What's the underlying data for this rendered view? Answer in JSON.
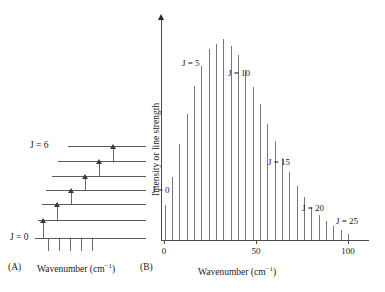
{
  "figure": {
    "panels": [
      {
        "tag": "(A)",
        "type": "energy-level-diagram",
        "axis_title": "Wavenumber (cm",
        "axis_title_sup": "−1",
        "axis_title_end": ")",
        "level_labels": [
          {
            "text": "J = 6",
            "J": 6
          },
          {
            "text": "J = 0",
            "J": 0
          }
        ],
        "levels": [
          {
            "J": 6,
            "y": 146,
            "x0": 68,
            "x1": 146
          },
          {
            "J": 5,
            "y": 161,
            "x0": 58,
            "x1": 146
          },
          {
            "J": 4,
            "y": 176,
            "x0": 52,
            "x1": 146
          },
          {
            "J": 3,
            "y": 190,
            "x0": 46,
            "x1": 146
          },
          {
            "J": 2,
            "y": 204,
            "x0": 42,
            "x1": 146
          },
          {
            "J": 1,
            "y": 220,
            "x0": 38,
            "x1": 146
          },
          {
            "J": 0,
            "y": 238,
            "x0": 35,
            "x1": 146
          }
        ],
        "transitions": [
          {
            "from_J": 0,
            "to_J": 1,
            "x": 43,
            "y_top": 220,
            "y_bottom": 238
          },
          {
            "from_J": 1,
            "to_J": 2,
            "x": 57,
            "y_top": 204,
            "y_bottom": 220
          },
          {
            "from_J": 2,
            "to_J": 3,
            "x": 71,
            "y_top": 190,
            "y_bottom": 204
          },
          {
            "from_J": 3,
            "to_J": 4,
            "x": 85,
            "y_top": 176,
            "y_bottom": 190
          },
          {
            "from_J": 4,
            "to_J": 5,
            "x": 99,
            "y_top": 161,
            "y_bottom": 176
          },
          {
            "from_J": 5,
            "to_J": 6,
            "x": 113,
            "y_top": 146,
            "y_bottom": 161
          }
        ],
        "ticks": [
          {
            "x": 48
          },
          {
            "x": 59
          },
          {
            "x": 70
          },
          {
            "x": 81
          },
          {
            "x": 92
          }
        ]
      },
      {
        "tag": "(B)",
        "type": "stick-spectrum",
        "ylabel": "Intensity or line strength",
        "xlabel": "Wavenumber (cm",
        "xlabel_sup": "−1",
        "xlabel_end": ")",
        "j_annotations": [
          {
            "text": "J = 0",
            "J": 0
          },
          {
            "text": "J = 5",
            "J": 5
          },
          {
            "text": "J = 10",
            "J": 10
          },
          {
            "text": "J = 15",
            "J": 15
          },
          {
            "text": "J = 20",
            "J": 20
          },
          {
            "text": "J = 25",
            "J": 25
          }
        ]
      }
    ]
  },
  "chart_data": {
    "type": "bar",
    "title": "",
    "subtitle": "",
    "xlabel": "Wavenumber (cm−1)",
    "ylabel": "Intensity or line strength",
    "xlim": [
      0,
      108
    ],
    "ylim": [
      0,
      1.0
    ],
    "grid": false,
    "legend": null,
    "xticks": [
      0,
      50,
      100
    ],
    "xticklabels": [
      "0",
      "50",
      "100"
    ],
    "yticks": [],
    "yticklabels": [],
    "series": [
      {
        "name": "Rotational line strength",
        "quantum_number": "J",
        "x": [
          2,
          5.8,
          9.6,
          13.4,
          17.2,
          21,
          24.8,
          28.6,
          32.4,
          36.2,
          40,
          43.8,
          47.6,
          51.4,
          55.2,
          59,
          62.8,
          66.6,
          70.4,
          74.2,
          78,
          81.8,
          85.6,
          89.4,
          93.2,
          97
        ],
        "J_values": [
          0,
          1,
          2,
          3,
          4,
          5,
          6,
          7,
          8,
          9,
          10,
          11,
          12,
          13,
          14,
          15,
          16,
          17,
          18,
          19,
          20,
          21,
          22,
          23,
          24,
          25
        ],
        "values": [
          0.165,
          0.295,
          0.455,
          0.595,
          0.725,
          0.82,
          0.9,
          0.925,
          0.95,
          0.915,
          0.875,
          0.8,
          0.72,
          0.64,
          0.545,
          0.465,
          0.385,
          0.32,
          0.255,
          0.205,
          0.155,
          0.12,
          0.09,
          0.065,
          0.045,
          0.03
        ]
      }
    ],
    "annotations": [
      {
        "label": "J = 0",
        "at_J": 0
      },
      {
        "label": "J = 5",
        "at_J": 5
      },
      {
        "label": "J = 10",
        "at_J": 10
      },
      {
        "label": "J = 15",
        "at_J": 15
      },
      {
        "label": "J = 20",
        "at_J": 20
      },
      {
        "label": "J = 25",
        "at_J": 25
      }
    ]
  },
  "colors": {
    "line": "#777777",
    "axis": "#4a4a4a",
    "level": "#5a5a5a",
    "text": "#1a1a1a",
    "background": "#ffffff"
  }
}
